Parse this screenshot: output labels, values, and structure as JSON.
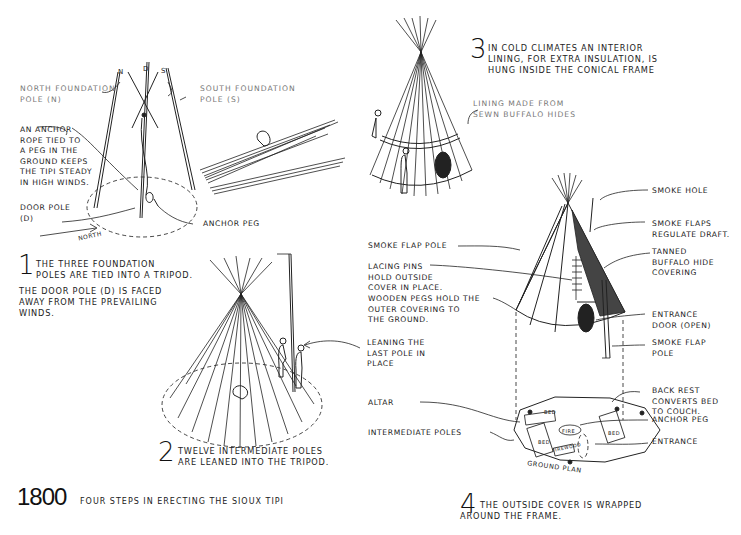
{
  "diagram": {
    "year": "1800",
    "title": "Four steps in erecting the Sioux tipi",
    "steps": [
      {
        "number": "1",
        "text": "The three foundation\npoles are tied into a tripod.",
        "note": "The door pole (D) is faced\naway from the prevailing\nwinds.",
        "labels": {
          "north_pole": "North foundation\npole (N)",
          "south_pole": "South foundation\npole (S)",
          "pole_letters": [
            "N",
            "D",
            "S"
          ],
          "anchor_rope": "An anchor\nrope tied to\na peg in the\nground keeps\nthe tipi steady\nin high winds.",
          "door_pole": "Door pole\n(D)",
          "anchor_peg": "Anchor peg",
          "north_arrow": "North"
        }
      },
      {
        "number": "2",
        "text": "Twelve intermediate poles\nare leaned into the tripod.",
        "labels": {
          "leaning_last_pole": "Leaning the\nlast pole in\nplace"
        }
      },
      {
        "number": "3",
        "text": "In cold climates an interior\nlining, for extra insulation, is\nhung inside the conical frame",
        "labels": {
          "lining": "Lining made from\nsewn buffalo hides"
        }
      },
      {
        "number": "4",
        "text": "The outside cover is wrapped\naround the frame.",
        "labels": {
          "smoke_hole": "Smoke hole",
          "smoke_flaps": "Smoke flaps\nregulate draft.",
          "smoke_flap_pole_left": "Smoke flap pole",
          "tanned_hide": "Tanned\nbuffalo hide\ncovering",
          "lacing_pins": "Lacing pins\nhold outside\ncover in place.",
          "wooden_pegs": "Wooden pegs hold the\nouter covering to\nthe ground.",
          "entrance_door": "Entrance\ndoor (open)",
          "smoke_flap_pole_right": "Smoke flap\npole",
          "back_rest": "Back rest\nconverts bed\nto couch.",
          "altar": "Altar",
          "anchor_peg": "Anchor peg",
          "intermediate_poles": "Intermediate poles",
          "entrance": "Entrance",
          "ground_plan": "Ground plan",
          "plan_items": [
            "Bed",
            "Bed",
            "Bed",
            "Fire",
            "Firewood"
          ]
        }
      }
    ]
  }
}
